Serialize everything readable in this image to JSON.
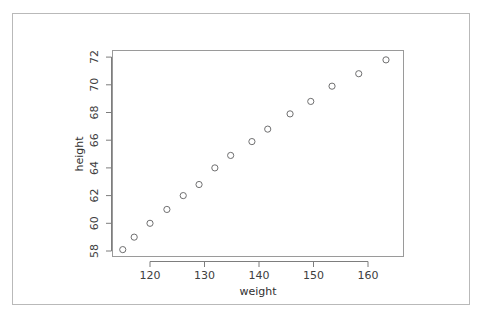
{
  "chart_data": {
    "type": "scatter",
    "title": "",
    "xlabel": "weight",
    "ylabel": "height",
    "xlim": [
      113.5,
      165.5
    ],
    "ylim": [
      57.5,
      72.4
    ],
    "xticks": [
      120,
      130,
      140,
      150,
      160
    ],
    "yticks": [
      58,
      60,
      62,
      64,
      66,
      68,
      70,
      72
    ],
    "grid": false,
    "legend": null,
    "marker": "open-circle",
    "marker_color": "#6f6f70",
    "points": [
      {
        "weight": 115.0,
        "height": 58.1
      },
      {
        "weight": 117.1,
        "height": 59.0
      },
      {
        "weight": 120.0,
        "height": 60.0
      },
      {
        "weight": 123.1,
        "height": 61.0
      },
      {
        "weight": 126.1,
        "height": 62.0
      },
      {
        "weight": 129.0,
        "height": 62.8
      },
      {
        "weight": 131.9,
        "height": 64.0
      },
      {
        "weight": 134.8,
        "height": 64.9
      },
      {
        "weight": 138.7,
        "height": 65.9
      },
      {
        "weight": 141.6,
        "height": 66.8
      },
      {
        "weight": 145.7,
        "height": 67.9
      },
      {
        "weight": 149.5,
        "height": 68.8
      },
      {
        "weight": 153.4,
        "height": 69.9
      },
      {
        "weight": 158.3,
        "height": 70.8
      },
      {
        "weight": 163.3,
        "height": 71.8
      }
    ],
    "x": [
      115.0,
      117.1,
      120.0,
      123.1,
      126.1,
      129.0,
      131.9,
      134.8,
      138.7,
      141.6,
      145.7,
      149.5,
      153.4,
      158.3,
      163.3
    ],
    "y": [
      58.1,
      59.0,
      60.0,
      61.0,
      62.0,
      62.8,
      64.0,
      64.9,
      65.9,
      66.8,
      67.9,
      68.8,
      69.9,
      70.8,
      71.8
    ]
  },
  "axis": {
    "x_title": "weight",
    "y_title": "height",
    "x_tick_labels": [
      "120",
      "130",
      "140",
      "150",
      "160"
    ],
    "y_tick_labels": [
      "58",
      "60",
      "62",
      "64",
      "66",
      "68",
      "70",
      "72"
    ]
  },
  "colors": {
    "outer_frame": "#b9b9b9",
    "plot_border": "#9a9a9a",
    "axis": "#7d7d7d",
    "marker": "#6f6f70",
    "text": "#353535",
    "background": "#ffffff"
  }
}
